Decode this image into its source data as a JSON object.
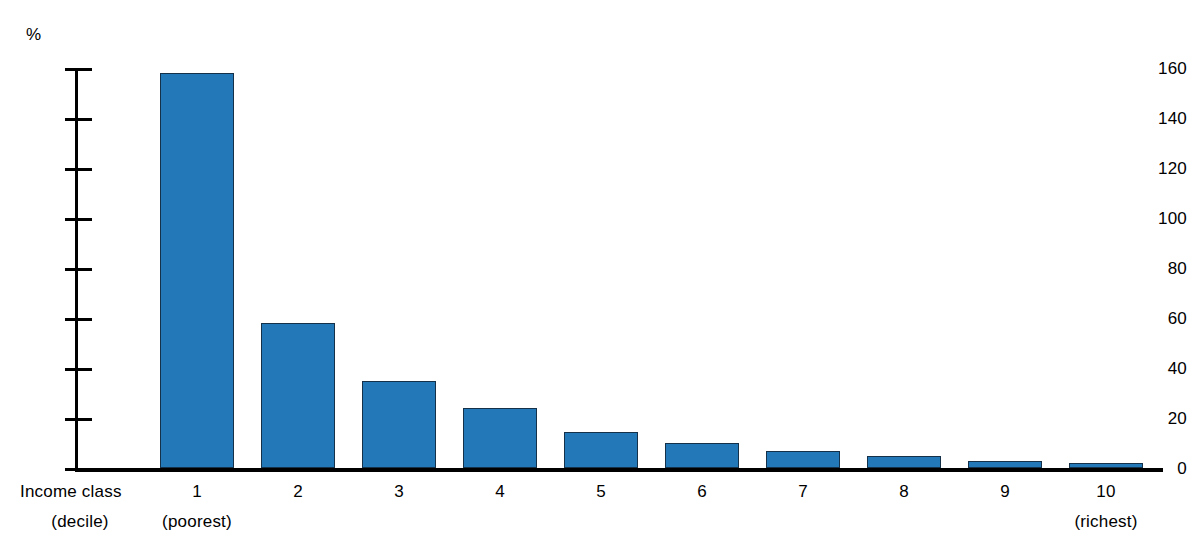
{
  "chart_data": {
    "type": "bar",
    "title": "",
    "subtitle": "",
    "xlabel": "Income class (decile)",
    "ylabel": "%",
    "categories": [
      "1",
      "2",
      "3",
      "4",
      "5",
      "6",
      "7",
      "8",
      "9",
      "10"
    ],
    "values": [
      158,
      58,
      35,
      24,
      14.5,
      10,
      7,
      5,
      3,
      2
    ],
    "ylim": [
      0,
      160
    ],
    "yticks": [
      0,
      20,
      40,
      60,
      80,
      100,
      120,
      140,
      160
    ],
    "ytick_labels": [
      "0",
      "20",
      "40",
      "60",
      "80",
      "100",
      "120",
      "140",
      "160"
    ],
    "grid": false,
    "legend": null,
    "series": [
      {
        "name": "",
        "values": [
          158,
          58,
          35,
          24,
          14.5,
          10,
          7,
          5,
          3,
          2
        ]
      }
    ],
    "annotations": [
      {
        "category": "1",
        "text": "(poorest)"
      },
      {
        "category": "10",
        "text": "(richest)"
      }
    ],
    "bar_color": "#2378b8",
    "bar_edge_color": "#15314a"
  },
  "axes": {
    "y_unit_label": "%",
    "y_tick_labels": [
      "160",
      "140",
      "120",
      "100",
      "80",
      "60",
      "40",
      "20",
      "0"
    ],
    "x_title_line1": "Income class",
    "x_title_line2": "(decile)",
    "x_tick_labels": [
      "1",
      "2",
      "3",
      "4",
      "5",
      "6",
      "7",
      "8",
      "9",
      "10"
    ],
    "x_sub_first": "(poorest)",
    "x_sub_last": "(richest)"
  }
}
